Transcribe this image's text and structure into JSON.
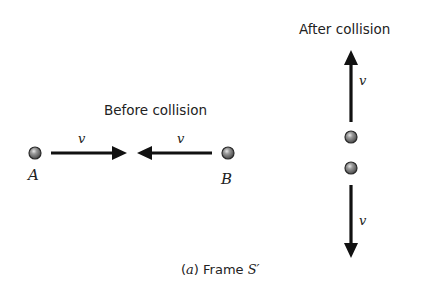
{
  "diagram": {
    "before": {
      "title": "Before collision",
      "particle_a": {
        "label": "A",
        "velocity_label": "v",
        "direction": "right"
      },
      "particle_b": {
        "label": "B",
        "velocity_label": "v",
        "direction": "left"
      }
    },
    "after": {
      "title": "After collision",
      "upper_particle": {
        "velocity_label": "v",
        "direction": "up"
      },
      "lower_particle": {
        "velocity_label": "v",
        "direction": "down"
      }
    },
    "caption": {
      "part": "a",
      "open_paren": "(",
      "close_paren": ")",
      "text": " Frame ",
      "frame_symbol": "S′"
    },
    "colors": {
      "arrow": "#111111",
      "ball_fill": "#8a8a8a",
      "ball_edge": "#2a2a2a",
      "text": "#222222"
    }
  }
}
